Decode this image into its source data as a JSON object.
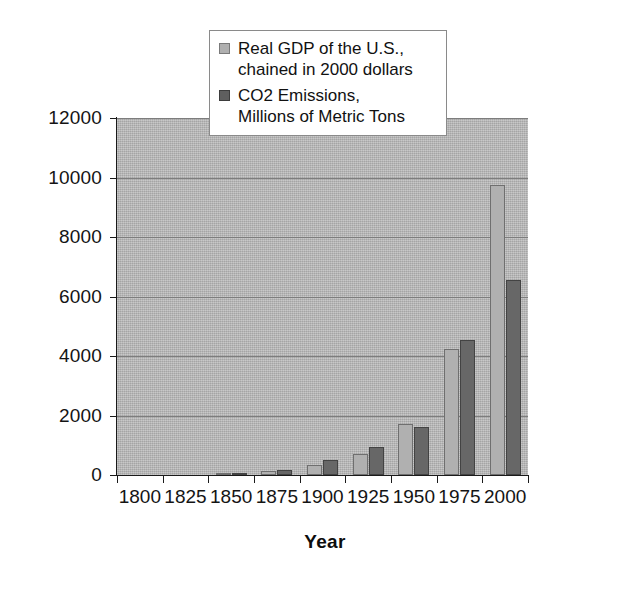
{
  "chart_data": {
    "type": "bar",
    "title": "",
    "subtitle": "",
    "xlabel": "Year",
    "ylabel": "",
    "categories": [
      "1800",
      "1825",
      "1850",
      "1875",
      "1900",
      "1925",
      "1950",
      "1975",
      "2000"
    ],
    "series": [
      {
        "name": "Real GDP of the U.S.,\nchained in 2000 dollars",
        "color": "#b0b0b0",
        "values": [
          0,
          0,
          60,
          150,
          330,
          700,
          1700,
          4250,
          9750
        ]
      },
      {
        "name": "CO2 Emissions,\nMillions of Metric Tons",
        "color": "#676767",
        "values": [
          0,
          0,
          50,
          180,
          500,
          950,
          1600,
          4550,
          6550
        ]
      }
    ],
    "ylim": [
      0,
      12000
    ],
    "y_ticks": [
      "0",
      "2000",
      "4000",
      "6000",
      "8000",
      "10000",
      "12000"
    ],
    "y_tick_values": [
      0,
      2000,
      4000,
      6000,
      8000,
      10000,
      12000
    ],
    "grid": true,
    "legend_position": "top-center",
    "plot_background": "#b3b3b3"
  },
  "legend": {
    "entries": [
      {
        "label": "Real GDP of the U.S.,\nchained in 2000 dollars",
        "swatch": "gdp-swatch"
      },
      {
        "label": "CO2 Emissions,\nMillions of Metric Tons",
        "swatch": "co2-swatch"
      }
    ]
  },
  "axes": {
    "x_title": "Year"
  }
}
